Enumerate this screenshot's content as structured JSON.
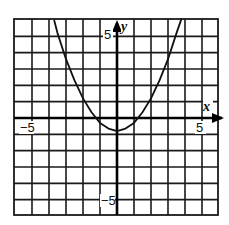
{
  "chart_data": {
    "type": "line",
    "title": "",
    "xlabel": "x",
    "ylabel": "y",
    "xlim": [
      -6,
      6
    ],
    "ylim": [
      -6,
      6
    ],
    "grid": true,
    "grid_step": 1,
    "tick_labels": {
      "x": [
        {
          "value": -5,
          "label": "−5"
        },
        {
          "value": 5,
          "label": "5"
        }
      ],
      "y": [
        {
          "value": 5,
          "label": "5"
        },
        {
          "value": -5,
          "label": "−5"
        }
      ]
    },
    "legend": null,
    "series": [
      {
        "name": "parabola",
        "equation": "y = 0.5x^2 - 1 (approx.)",
        "vertex": [
          0,
          -0.8
        ],
        "x_intercepts": [
          -1.2,
          1.2
        ],
        "x": [
          -3.7,
          -3.5,
          -3,
          -2.5,
          -2,
          -1.5,
          -1,
          -0.5,
          0,
          0.5,
          1,
          1.5,
          2,
          2.5,
          3,
          3.5,
          3.8
        ],
        "y": [
          6.0,
          5.2,
          3.6,
          2.3,
          1.2,
          0.35,
          -0.3,
          -0.65,
          -0.8,
          -0.65,
          -0.3,
          0.35,
          1.2,
          2.3,
          3.6,
          5.2,
          6.1
        ]
      }
    ],
    "axis_arrows": {
      "x": "right",
      "y": "up"
    }
  },
  "axes": {
    "x_name": "x",
    "y_name": "y",
    "x_neg_label": "−5",
    "x_pos_label": "5",
    "y_pos_label": "5",
    "y_neg_label": "−5"
  }
}
